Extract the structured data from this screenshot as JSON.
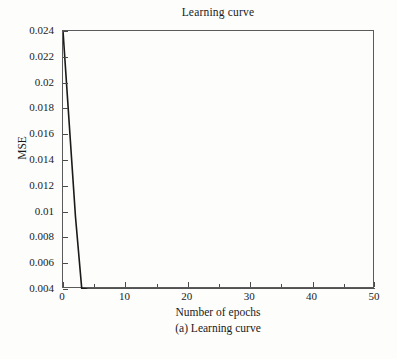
{
  "chart_data": {
    "type": "line",
    "title": "Learning curve",
    "xlabel": "Number of epochs",
    "ylabel": "MSE",
    "caption": "(a) Learning curve",
    "xlim": [
      0,
      50
    ],
    "ylim": [
      0.004,
      0.024
    ],
    "grid": false,
    "legend": null,
    "line_color": "#1a1a1a",
    "frame_color": "#5a5a5a",
    "background_color": "#fdfdfc",
    "x_ticks": [
      0,
      10,
      20,
      30,
      40,
      50
    ],
    "x_tick_labels": [
      "0",
      "10",
      "20",
      "30",
      "40",
      "50"
    ],
    "x_minor_ticks": [
      5,
      15,
      25,
      35,
      45
    ],
    "y_ticks": [
      0.004,
      0.006,
      0.008,
      0.01,
      0.012,
      0.014,
      0.016,
      0.018,
      0.02,
      0.022,
      0.024
    ],
    "y_tick_labels": [
      "0.004",
      "0.006",
      "0.008",
      "0.01",
      "0.012",
      "0.014",
      "0.016",
      "0.018",
      "0.02",
      "0.022",
      "0.024"
    ],
    "series": [
      {
        "name": "MSE",
        "x": [
          0,
          1,
          2,
          3,
          4,
          5,
          10,
          15,
          20,
          25,
          30,
          35,
          40,
          45,
          50
        ],
        "values": [
          0.024,
          0.0168,
          0.0096,
          0.00405,
          0.004,
          0.004,
          0.004,
          0.004,
          0.004,
          0.004,
          0.004,
          0.004,
          0.004,
          0.004,
          0.004
        ]
      }
    ]
  }
}
